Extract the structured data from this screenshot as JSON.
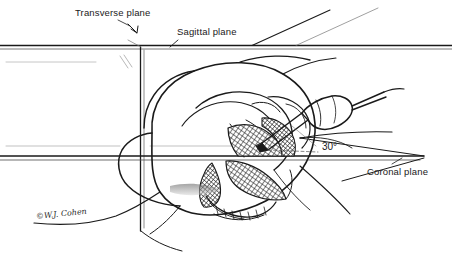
{
  "figure": {
    "domain": "anatomical-line-drawing",
    "background_color": "#ffffff",
    "ink_color": "#1a1a1a",
    "width": 452,
    "height": 259
  },
  "labels": {
    "transverse_plane": "Transverse plane",
    "sagittal_plane": "Sagittal plane",
    "coronal_plane": "Coronal plane",
    "angle": "30°"
  },
  "signature": {
    "text": "©W.J. Cohen"
  },
  "planes": [
    {
      "id": "transverse",
      "label": "Transverse plane",
      "orientation": "horizontal",
      "y": 47
    },
    {
      "id": "sagittal",
      "label": "Sagittal plane",
      "orientation": "vertical",
      "x": 141
    },
    {
      "id": "coronal",
      "label": "Coronal plane",
      "orientation": "horizontal",
      "y": 157
    }
  ],
  "instrument": {
    "name": "surgical handpiece",
    "angle_to_coronal_plane": "30°"
  },
  "shaded_regions": [
    {
      "id": "upper-hatched-structure",
      "pattern": "cross-hatch"
    },
    {
      "id": "lower-hatched-structure",
      "pattern": "cross-hatch"
    }
  ]
}
